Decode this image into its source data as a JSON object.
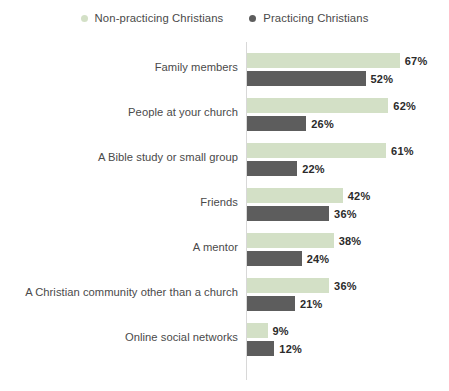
{
  "legend": {
    "position": "top-center",
    "entries": [
      {
        "label": "Non-practicing Christians",
        "color": "#d3e0c6",
        "marker": "legend-dot-icon"
      },
      {
        "label": "Practicing Christians",
        "color": "#5d5d5d",
        "marker": "legend-dot-icon"
      }
    ]
  },
  "chart_data": {
    "type": "bar",
    "orientation": "horizontal",
    "title": "",
    "subtitle": "",
    "xlabel": "",
    "ylabel": "",
    "grid": false,
    "legend_position": "top-center",
    "axis_line": true,
    "xlim": [
      0,
      70
    ],
    "value_suffix": "%",
    "categories": [
      "Family members",
      "People at your church",
      "A Bible study or small group",
      "Friends",
      "A mentor",
      "A Christian community other than a church",
      "Online social networks"
    ],
    "series": [
      {
        "name": "Non-practicing Christians",
        "color": "#d3e0c6",
        "values": [
          67,
          62,
          61,
          42,
          38,
          36,
          9
        ],
        "labels": [
          "67%",
          "62%",
          "61%",
          "42%",
          "38%",
          "36%",
          "9%"
        ]
      },
      {
        "name": "Practicing Christians",
        "color": "#5d5d5d",
        "values": [
          52,
          26,
          22,
          36,
          24,
          21,
          12
        ],
        "labels": [
          "52%",
          "26%",
          "22%",
          "36%",
          "24%",
          "21%",
          "12%"
        ]
      }
    ]
  }
}
